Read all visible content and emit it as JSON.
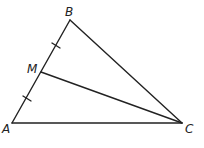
{
  "diagram": {
    "type": "triangle-with-median",
    "stroke_color": "#222222",
    "background": "#ffffff",
    "points": {
      "A": {
        "label": "A",
        "x": 12,
        "y": 123
      },
      "B": {
        "label": "B",
        "x": 70,
        "y": 20
      },
      "C": {
        "label": "C",
        "x": 182,
        "y": 123
      },
      "M": {
        "label": "M",
        "x": 41,
        "y": 72
      }
    },
    "segments": [
      "AB",
      "BC",
      "CA",
      "MC"
    ],
    "congruence_marks": [
      "BM",
      "MA"
    ]
  }
}
